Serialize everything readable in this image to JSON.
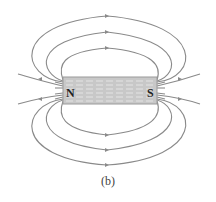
{
  "figure": {
    "caption": "(b)",
    "magnet": {
      "north_label": "N",
      "south_label": "S",
      "fill_color": "#c8c8c8",
      "stripe_color": "#e6e6e6",
      "border_color": "#9a9a9a"
    },
    "field_line_color": "#8a8a8a",
    "field_lines": {
      "closed_loops_top": 3,
      "closed_loops_bottom": 3,
      "open_lines_left": 2,
      "open_lines_right": 2
    }
  }
}
